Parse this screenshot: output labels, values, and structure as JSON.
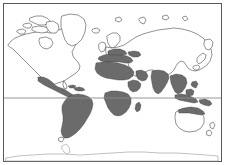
{
  "figure": {
    "type": "thematic-world-map",
    "title": "",
    "caption": "",
    "projection": "equirectangular"
  },
  "colors": {
    "background": "#ffffff",
    "frame_border": "#5a5a5a",
    "coastline": "#4a4a4a",
    "coastline_faint": "#8d8d8d",
    "shaded_region": "#6b6b6b",
    "shaded_region_outline": "#3d3d3d",
    "equator_line": "#8a8a8a"
  },
  "frame": {
    "left": 3,
    "top": 3,
    "width": 219,
    "height": 159,
    "border_width": 1
  },
  "graticule": {
    "equator_label": "Equator",
    "equator_y": 98,
    "lines_visible": 1
  },
  "legend": {
    "visible": false,
    "entries": [
      {
        "label": "Distribution area",
        "swatch": "#6b6b6b"
      },
      {
        "label": "Outside range",
        "swatch": "#ffffff"
      }
    ]
  },
  "landmasses": [
    {
      "name": "north-america",
      "shaded": false
    },
    {
      "name": "greenland",
      "shaded": false
    },
    {
      "name": "central-america",
      "shaded": true
    },
    {
      "name": "caribbean-islands",
      "shaded": true
    },
    {
      "name": "south-america",
      "shaded": true
    },
    {
      "name": "europe",
      "shaded": false
    },
    {
      "name": "mediterranean-southern-europe",
      "shaded": true
    },
    {
      "name": "north-africa-sahel",
      "shaded": true
    },
    {
      "name": "sub-saharan-africa",
      "shaded": true
    },
    {
      "name": "southern-africa",
      "shaded": true
    },
    {
      "name": "madagascar",
      "shaded": true
    },
    {
      "name": "arabian-peninsula",
      "shaded": true
    },
    {
      "name": "india-south-asia",
      "shaded": true
    },
    {
      "name": "southeast-asia",
      "shaded": true
    },
    {
      "name": "indonesia-archipelago",
      "shaded": true
    },
    {
      "name": "northern-australia",
      "shaded": true
    },
    {
      "name": "southern-australia",
      "shaded": false
    },
    {
      "name": "new-zealand",
      "shaded": false
    },
    {
      "name": "russia-northern-asia",
      "shaded": false
    },
    {
      "name": "japan",
      "shaded": false
    },
    {
      "name": "antarctica",
      "shaded": false
    }
  ],
  "shaded_region_count": 16,
  "map_elements": {
    "frame_name": "map-border",
    "canvas_name": "world-map-canvas"
  }
}
